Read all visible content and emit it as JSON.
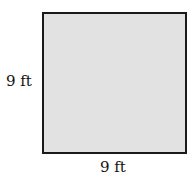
{
  "diagram": {
    "shape": "square",
    "fill_color": "#e2e2e2",
    "stroke_color": "#1a1a1a",
    "side_label_left": "9 ft",
    "side_label_bottom": "9 ft"
  }
}
